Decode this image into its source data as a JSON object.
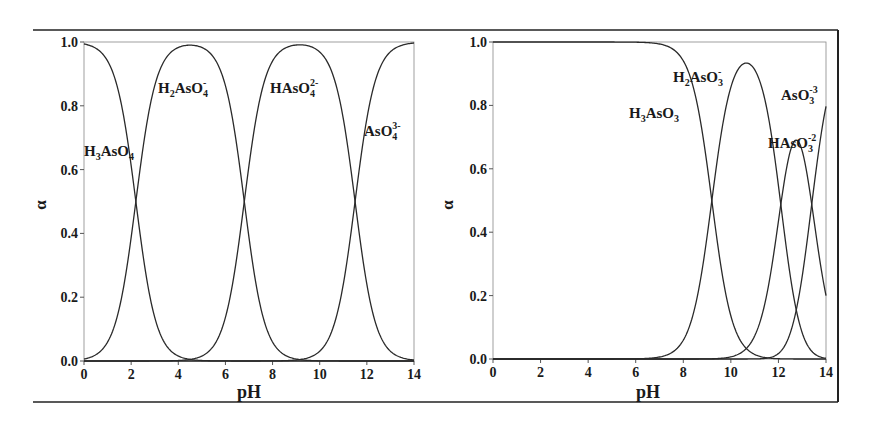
{
  "chart_data": [
    {
      "type": "line",
      "title": "",
      "xlabel": "pH",
      "ylabel": "α",
      "xlim": [
        0,
        14
      ],
      "ylim": [
        0,
        1.0
      ],
      "xticks": [
        "0",
        "2",
        "4",
        "6",
        "8",
        "10",
        "12",
        "14"
      ],
      "yticks": [
        "0.0",
        "0.2",
        "0.4",
        "0.6",
        "0.8",
        "1.0"
      ],
      "grid": false,
      "legend": "inline labels",
      "pKa": [
        2.2,
        6.8,
        11.5
      ],
      "series": [
        {
          "name": "H3AsO4",
          "x": [
            0,
            1,
            2,
            2.2,
            3,
            4,
            5,
            6,
            7,
            8,
            9,
            10,
            11,
            12,
            13,
            14
          ],
          "values": [
            0.99,
            0.94,
            0.61,
            0.5,
            0.14,
            0.02,
            0.0,
            0.0,
            0.0,
            0.0,
            0.0,
            0.0,
            0.0,
            0.0,
            0.0,
            0.0
          ]
        },
        {
          "name": "H2AsO4-",
          "x": [
            0,
            1,
            2,
            2.2,
            3,
            4,
            4.5,
            5,
            6,
            6.8,
            7,
            8,
            9,
            10,
            11,
            12,
            13,
            14
          ],
          "values": [
            0.01,
            0.06,
            0.39,
            0.5,
            0.86,
            0.98,
            0.99,
            0.98,
            0.86,
            0.5,
            0.39,
            0.06,
            0.01,
            0.0,
            0.0,
            0.0,
            0.0,
            0.0
          ]
        },
        {
          "name": "HAsO4 2-",
          "x": [
            0,
            4,
            5,
            6,
            6.8,
            7,
            8,
            9,
            9.15,
            10,
            11,
            11.5,
            12,
            13,
            14
          ],
          "values": [
            0.0,
            0.0,
            0.02,
            0.14,
            0.5,
            0.61,
            0.94,
            0.99,
            0.99,
            0.97,
            0.76,
            0.5,
            0.24,
            0.03,
            0.0
          ]
        },
        {
          "name": "AsO4 3-",
          "x": [
            0,
            8,
            9,
            10,
            11,
            11.5,
            12,
            13,
            14
          ],
          "values": [
            0.0,
            0.0,
            0.0,
            0.03,
            0.24,
            0.5,
            0.76,
            0.97,
            1.0
          ]
        }
      ],
      "labels": [
        {
          "text": "H3AsO4",
          "x": 0.0,
          "y": 0.65
        },
        {
          "text": "H2AsO4-",
          "x": 2.6,
          "y": 0.84
        },
        {
          "text": "HAsO4 2-",
          "x": 7.5,
          "y": 0.84
        },
        {
          "text": "AsO4 3-",
          "x": 11.7,
          "y": 0.69
        }
      ]
    },
    {
      "type": "line",
      "title": "",
      "xlabel": "pH",
      "ylabel": "α",
      "xlim": [
        0,
        14
      ],
      "ylim": [
        0,
        1.0
      ],
      "xticks": [
        "0",
        "2",
        "4",
        "6",
        "8",
        "10",
        "12",
        "14"
      ],
      "yticks": [
        "0.0",
        "0.2",
        "0.4",
        "0.6",
        "0.8",
        "1.0"
      ],
      "grid": false,
      "legend": "inline labels",
      "pKa": [
        9.2,
        12.1,
        13.4
      ],
      "series": [
        {
          "name": "H3AsO3",
          "x": [
            0,
            6,
            7,
            8,
            9,
            9.2,
            10,
            11,
            12,
            13,
            14
          ],
          "values": [
            1.0,
            1.0,
            0.99,
            0.94,
            0.61,
            0.5,
            0.13,
            0.02,
            0.0,
            0.0,
            0.0
          ]
        },
        {
          "name": "H2AsO3-",
          "x": [
            0,
            7,
            8,
            9,
            9.2,
            10,
            10.65,
            11,
            12,
            12.1,
            13,
            14
          ],
          "values": [
            0.0,
            0.01,
            0.06,
            0.39,
            0.5,
            0.86,
            0.93,
            0.9,
            0.53,
            0.48,
            0.1,
            0.02
          ]
        },
        {
          "name": "HAsO3 2-",
          "x": [
            0,
            10,
            11,
            12,
            12.1,
            12.7,
            13,
            13.4,
            14
          ],
          "values": [
            0.0,
            0.0,
            0.07,
            0.43,
            0.48,
            0.66,
            0.6,
            0.46,
            0.18
          ]
        },
        {
          "name": "AsO3 3-",
          "x": [
            0,
            11,
            12,
            13,
            13.4,
            14
          ],
          "values": [
            0.0,
            0.0,
            0.02,
            0.27,
            0.46,
            0.82
          ]
        }
      ],
      "labels": [
        {
          "text": "H3AsO3",
          "x": 6.0,
          "y": 0.83
        },
        {
          "text": "H2AsO3-",
          "x": 8.9,
          "y": 0.95
        },
        {
          "text": "HAsO3 2-",
          "x": 12.0,
          "y": 0.75
        },
        {
          "text": "AsO3 3-",
          "x": 12.9,
          "y": 0.87
        }
      ]
    }
  ],
  "panels": [
    {
      "ylabel": "α",
      "xlabel": "pH",
      "yticks": [
        "0.0",
        "0.2",
        "0.4",
        "0.6",
        "0.8",
        "1.0"
      ],
      "xticks": [
        "0",
        "2",
        "4",
        "6",
        "8",
        "10",
        "12",
        "14"
      ],
      "labels": [
        {
          "main": "H",
          "sub1": "3",
          "mid": "AsO",
          "sub2": "4",
          "sup": ""
        },
        {
          "main": "H",
          "sub1": "2",
          "mid": "AsO",
          "sub2": "4",
          "sup": "-"
        },
        {
          "main": "",
          "sub1": "",
          "mid": "HAsO",
          "sub2": "4",
          "sup": "2-"
        },
        {
          "main": "",
          "sub1": "",
          "mid": "AsO",
          "sub2": "4",
          "sup": "3-"
        }
      ]
    },
    {
      "ylabel": "α",
      "xlabel": "pH",
      "yticks": [
        "0.0",
        "0.2",
        "0.4",
        "0.6",
        "0.8",
        "1.0"
      ],
      "xticks": [
        "0",
        "2",
        "4",
        "6",
        "8",
        "10",
        "12",
        "14"
      ],
      "labels": [
        {
          "main": "H",
          "sub1": "3",
          "mid": "AsO",
          "sub2": "3",
          "sup": ""
        },
        {
          "main": "H",
          "sub1": "2",
          "mid": "AsO",
          "sub2": "3",
          "sup": "-"
        },
        {
          "main": "",
          "sub1": "",
          "mid": "HAsO",
          "sub2": "3",
          "sup": "-2"
        },
        {
          "main": "",
          "sub1": "",
          "mid": "AsO",
          "sub2": "3",
          "sup": "-3"
        }
      ]
    }
  ],
  "colors": {
    "line": "#2a2a2a",
    "axis": "#555555",
    "frame": "#222222",
    "text": "#1a1a1a"
  }
}
